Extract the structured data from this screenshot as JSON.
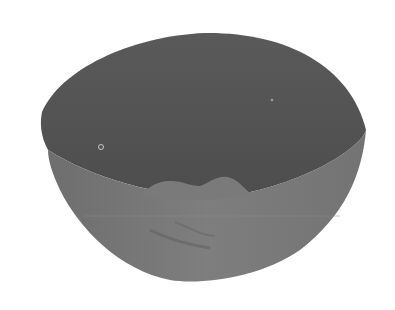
{
  "image": {
    "subject": "bowl",
    "description": "Grayscale photograph of an empty hemispherical bowl viewed from slightly above",
    "colors": {
      "background": "#ffffff",
      "interior": "#575757",
      "interior_dark": "#4a4a4a",
      "exterior": "#7a7a7a",
      "exterior_dark": "#666666",
      "highlight": "#8c8c8c",
      "glare": "#bdbdbd"
    }
  }
}
